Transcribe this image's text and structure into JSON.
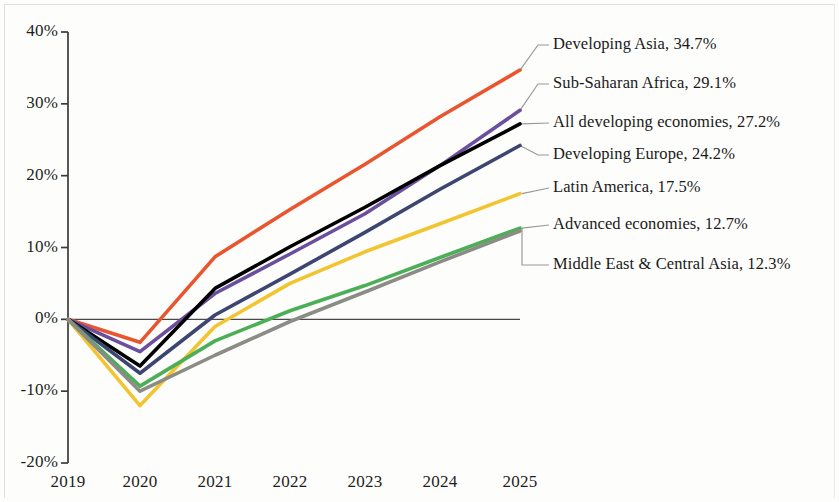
{
  "chart_data": {
    "type": "line",
    "title": "",
    "subtitle": "",
    "xlabel": "",
    "ylabel": "",
    "x": [
      "2019",
      "2020",
      "2021",
      "2022",
      "2023",
      "2024",
      "2025"
    ],
    "xtick_labels": [
      "2019",
      "2020",
      "2021",
      "2022",
      "2023",
      "2024",
      "2025"
    ],
    "ytick_labels": [
      "40%",
      "30%",
      "20%",
      "10%",
      "0%",
      "-10%",
      "-20%"
    ],
    "ytick_values": [
      40,
      30,
      20,
      10,
      0,
      -10,
      -20
    ],
    "ylim": [
      -20,
      40
    ],
    "grid": false,
    "zero_line": true,
    "legend_position": "right-endpoint-labels",
    "series": [
      {
        "name": "Developing Asia",
        "end_label": "Developing Asia, 34.7%",
        "end_value": 34.7,
        "color": "#e8552f",
        "values": [
          0.0,
          -3.2,
          8.7,
          15.3,
          21.6,
          28.2,
          34.7
        ]
      },
      {
        "name": "Sub-Saharan Africa",
        "end_label": "Sub-Saharan Africa, 29.1%",
        "end_value": 29.1,
        "color": "#6b4f9e",
        "values": [
          0.0,
          -4.5,
          3.6,
          9.1,
          14.7,
          21.4,
          29.1
        ]
      },
      {
        "name": "All developing economies",
        "end_label": "All developing economies, 27.2%",
        "end_value": 27.2,
        "color": "#000000",
        "values": [
          0.0,
          -6.5,
          4.3,
          10.1,
          15.6,
          21.4,
          27.2
        ]
      },
      {
        "name": "Developing Europe",
        "end_label": "Developing Europe, 24.2%",
        "end_value": 24.2,
        "color": "#3d4670",
        "values": [
          0.0,
          -7.5,
          0.6,
          6.3,
          12.1,
          18.1,
          24.2
        ]
      },
      {
        "name": "Latin America",
        "end_label": "Latin America, 17.5%",
        "end_value": 17.5,
        "color": "#f2c530",
        "values": [
          0.0,
          -12.0,
          -1.0,
          5.0,
          9.4,
          13.3,
          17.5
        ]
      },
      {
        "name": "Advanced economies",
        "end_label": "Advanced economies, 12.7%",
        "end_value": 12.7,
        "color": "#4caf58",
        "values": [
          0.0,
          -9.3,
          -3.0,
          1.2,
          4.7,
          8.6,
          12.7
        ]
      },
      {
        "name": "Middle East & Central Asia",
        "end_label": "Middle East & Central Asia, 12.3%",
        "end_value": 12.3,
        "color": "#8c8c86",
        "values": [
          0.0,
          -10.0,
          -5.0,
          -0.3,
          3.8,
          8.0,
          12.3
        ]
      }
    ],
    "annotations": [
      "Developing Asia, 34.7%",
      "Sub-Saharan Africa, 29.1%",
      "All developing economies, 27.2%",
      "Developing Europe, 24.2%",
      "Latin America, 17.5%",
      "Advanced economies, 12.7%",
      "Middle East & Central Asia, 12.3%"
    ],
    "axis_color": "#3a3a3a",
    "zero_line_color": "#4a4a4a",
    "leader_color": "#9a9a95",
    "background": "#fdfdfc"
  }
}
